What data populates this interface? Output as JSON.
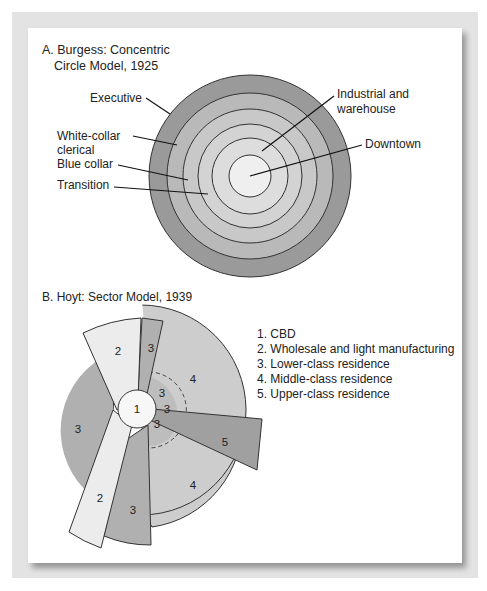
{
  "burgess": {
    "title_line1": "A. Burgess: Concentric",
    "title_line2": "Circle Model, 1925",
    "labels": {
      "executive": "Executive",
      "white_collar_1": "White-collar",
      "white_collar_2": "clerical",
      "blue_collar": "Blue collar",
      "transition": "Transition",
      "industrial_1": "Industrial and",
      "industrial_2": "warehouse",
      "downtown": "Downtown"
    },
    "colors": {
      "executive": "#9a9a9a",
      "white_collar": "#b9b9b9",
      "blue_collar": "#c8c8c8",
      "transition": "#d3d3d3",
      "industrial": "#dddddd",
      "downtown": "#eeeeee"
    }
  },
  "hoyt": {
    "title": "B. Hoyt: Sector Model, 1939",
    "sector_numbers": {
      "cbd": "1",
      "n2_top": "2",
      "n2_bottom": "2",
      "n3_topstrip": "3",
      "n3_left": "3",
      "n3_inner_a": "3",
      "n3_inner_b": "3",
      "n3_inner_c": "3",
      "n3_bottom": "3",
      "n4_top": "4",
      "n4_bottom": "4",
      "n5": "5"
    },
    "legend": [
      "1. CBD",
      "2. Wholesale and light manufacturing",
      "3. Lower-class residence",
      "4. Middle-class residence",
      "5. Upper-class residence"
    ],
    "colors": {
      "cbd": "#f7f7f7",
      "wholesale": "#ececec",
      "lower": "#b0b0b0",
      "middle": "#cdcdcd",
      "upper": "#a0a0a0"
    }
  }
}
